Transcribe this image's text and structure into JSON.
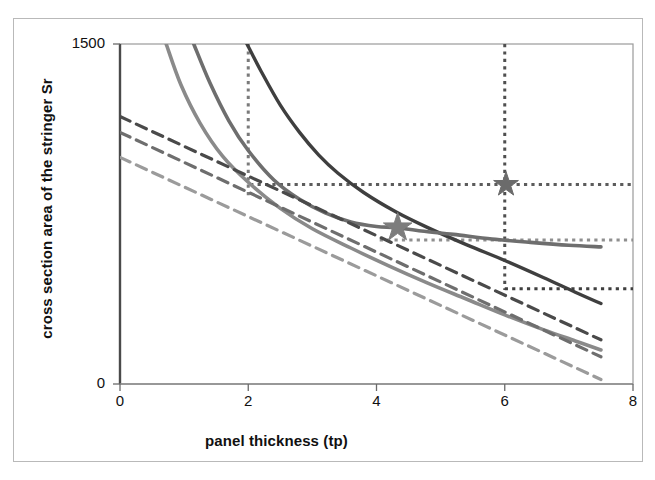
{
  "figure": {
    "background": "#ffffff",
    "frame_color": "#b9b9b9"
  },
  "chart_data": {
    "type": "line",
    "title": "",
    "xlabel": "panel thickness (tp)",
    "ylabel": "cross section area of the stringer Sr",
    "xlim": [
      0,
      8
    ],
    "ylim": [
      0,
      1500
    ],
    "xticks": [
      0,
      2,
      4,
      6,
      8
    ],
    "xticklabels": [
      "0",
      "2",
      "4",
      "6",
      "8"
    ],
    "yticks": [
      0,
      1500
    ],
    "yticklabels": [
      "0",
      "1500"
    ],
    "grid": false,
    "legend": "none",
    "series": [
      {
        "name": "solid-curve-dark",
        "style": "solid",
        "color": "#3f3f3f",
        "width": 3.4,
        "x": [
          1.98,
          2.2,
          2.5,
          2.8,
          3.1,
          3.4,
          3.8,
          4.3,
          4.8,
          5.4,
          6.0,
          6.6,
          7.1,
          7.5
        ],
        "y": [
          1500,
          1380,
          1230,
          1110,
          1010,
          930,
          845,
          760,
          690,
          615,
          545,
          470,
          405,
          355
        ]
      },
      {
        "name": "solid-curve-medium",
        "style": "solid",
        "color": "#6e6e6e",
        "width": 3.6,
        "x": [
          1.15,
          1.4,
          1.7,
          2.0,
          2.4,
          2.8,
          3.2,
          3.6,
          4.0,
          4.3,
          4.7,
          5.2,
          5.8,
          6.4,
          7.0,
          7.5
        ],
        "y": [
          1500,
          1330,
          1160,
          1030,
          900,
          815,
          755,
          715,
          695,
          690,
          675,
          660,
          640,
          625,
          612,
          605
        ]
      },
      {
        "name": "solid-curve-light",
        "style": "solid",
        "color": "#8a8a8a",
        "width": 3.6,
        "x": [
          0.72,
          0.95,
          1.25,
          1.6,
          2.0,
          2.5,
          3.0,
          3.6,
          4.2,
          4.8,
          5.4,
          6.0,
          6.6,
          7.1,
          7.5
        ],
        "y": [
          1500,
          1320,
          1150,
          1005,
          890,
          775,
          685,
          600,
          520,
          445,
          375,
          305,
          240,
          190,
          150
        ]
      },
      {
        "name": "dashed-line-dark",
        "style": "dashed",
        "color": "#4a4a4a",
        "width": 3.2,
        "x": [
          0.0,
          7.5
        ],
        "y": [
          1180,
          195
        ]
      },
      {
        "name": "dashed-line-medium",
        "style": "dashed",
        "color": "#6e6e6e",
        "width": 3.2,
        "x": [
          0.0,
          7.5
        ],
        "y": [
          1110,
          120
        ]
      },
      {
        "name": "dashed-line-light",
        "style": "dashed",
        "color": "#9b9b9b",
        "width": 3.2,
        "x": [
          0.0,
          7.5
        ],
        "y": [
          1000,
          20
        ]
      }
    ],
    "markers": [
      {
        "name": "star-marker-left",
        "shape": "star",
        "x": 4.33,
        "y": 690,
        "color": "#7d7d7d",
        "size": 30
      },
      {
        "name": "star-marker-right",
        "shape": "star",
        "x": 6.02,
        "y": 880,
        "color": "#6b6b6b",
        "size": 26
      }
    ],
    "reference_lines": [
      {
        "name": "vline-tp-2",
        "orientation": "vertical",
        "x": 2.0,
        "y_from": 1500,
        "y_to": 815,
        "color": "#7a7a7a",
        "style": "dotted"
      },
      {
        "name": "vline-tp-6",
        "orientation": "vertical",
        "x": 6.0,
        "y_from": 1500,
        "y_to": 415,
        "color": "#4f4f4f",
        "style": "dotted"
      },
      {
        "name": "hline-sr-880",
        "orientation": "horizontal",
        "y": 880,
        "x_from": 2.03,
        "x_to": 8.0,
        "color": "#5c5c5c",
        "style": "dotted"
      },
      {
        "name": "hline-sr-635",
        "orientation": "horizontal",
        "y": 635,
        "x_from": 4.05,
        "x_to": 8.0,
        "color": "#8f8f8f",
        "style": "dotted"
      },
      {
        "name": "hline-sr-420",
        "orientation": "horizontal",
        "y": 420,
        "x_from": 6.0,
        "x_to": 8.0,
        "color": "#3f3f3f",
        "style": "dotted"
      }
    ]
  }
}
